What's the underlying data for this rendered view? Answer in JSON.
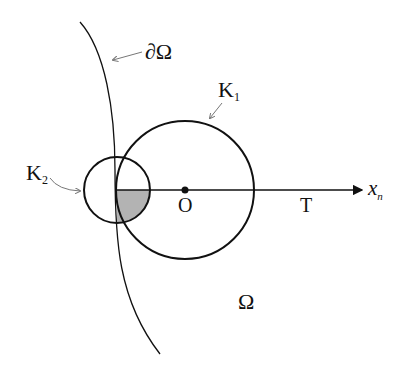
{
  "labels": {
    "boundary": "∂Ω",
    "k1": "K",
    "k1_sub": "1",
    "k2": "K",
    "k2_sub": "2",
    "origin": "O",
    "t": "T",
    "axis": "x",
    "axis_sub": "n",
    "domain": "Ω"
  },
  "colors": {
    "stroke": "#111111",
    "shade": "#b3b3b3",
    "arrow": "#888888"
  }
}
